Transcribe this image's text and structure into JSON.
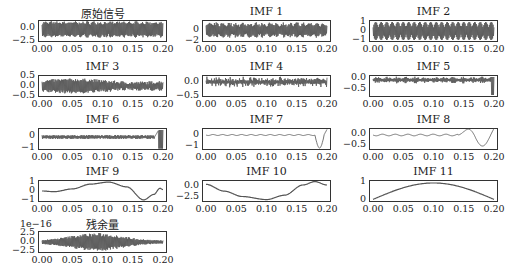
{
  "chart_data": [
    {
      "type": "line",
      "title": "原始信号",
      "xlabel": "",
      "ylabel": "",
      "x_ticks": [
        "0.00",
        "0.05",
        "0.10",
        "0.15",
        "0.20"
      ],
      "y_ticks": [
        "0.0",
        "−2.5"
      ],
      "xlim": [
        0,
        0.2
      ],
      "ylim": [
        -3,
        2.5
      ],
      "signal": "dense oscillation, amplitude ~±2.5, amplitude-modulated"
    },
    {
      "type": "line",
      "title": "IMF 1",
      "x_ticks": [
        "0.00",
        "0.05",
        "0.10",
        "0.15",
        "0.20"
      ],
      "y_ticks": [
        "0",
        "−2"
      ],
      "xlim": [
        0,
        0.2
      ],
      "ylim": [
        -2.2,
        1.8
      ],
      "signal": "dense high-frequency oscillation, amplitude ~±1.8"
    },
    {
      "type": "line",
      "title": "IMF 2",
      "x_ticks": [
        "0.00",
        "0.05",
        "0.10",
        "0.15",
        "0.20"
      ],
      "y_ticks": [
        "1",
        "0",
        "−1"
      ],
      "xlim": [
        0,
        0.2
      ],
      "ylim": [
        -1.3,
        1.3
      ],
      "signal": "dense oscillation, amplitude ~±1.2, beating envelope"
    },
    {
      "type": "line",
      "title": "IMF 3",
      "x_ticks": [
        "0.00",
        "0.05",
        "0.10",
        "0.15",
        "0.20"
      ],
      "y_ticks": [
        "0.5",
        "0.0",
        "−0.5"
      ],
      "xlim": [
        0,
        0.2
      ],
      "ylim": [
        -0.55,
        0.55
      ],
      "signal": "noisy oscillation, amplitude ~±0.4"
    },
    {
      "type": "line",
      "title": "IMF 4",
      "x_ticks": [
        "0.00",
        "0.05",
        "0.10",
        "0.15",
        "0.20"
      ],
      "y_ticks": [
        "0.0",
        "−0.5"
      ],
      "xlim": [
        0,
        0.2
      ],
      "ylim": [
        -0.6,
        0.35
      ],
      "signal": "bursty oscillation, amplitude ~±0.2"
    },
    {
      "type": "line",
      "title": "IMF 5",
      "x_ticks": [
        "0.00",
        "0.05",
        "0.10",
        "0.15",
        "0.20"
      ],
      "y_ticks": [
        "0.0",
        "−0.5"
      ],
      "xlim": [
        0,
        0.2
      ],
      "ylim": [
        -0.8,
        0.2
      ],
      "signal": "small oscillation near 0, large spike down at ~0.195"
    },
    {
      "type": "line",
      "title": "IMF 6",
      "x_ticks": [
        "0.00",
        "0.05",
        "0.10",
        "0.15",
        "0.20"
      ],
      "y_ticks": [
        "0",
        "−1"
      ],
      "xlim": [
        0,
        0.2
      ],
      "ylim": [
        -1.2,
        0.6
      ],
      "signal": "near 0 with small ripples; spike at ~0.19-0.195 reaching ~0.5 and ~-1.1"
    },
    {
      "type": "line",
      "title": "IMF 7",
      "x_ticks": [
        "0.00",
        "0.05",
        "0.10",
        "0.15",
        "0.20"
      ],
      "y_ticks": [
        "0",
        "−1"
      ],
      "xlim": [
        0,
        0.2
      ],
      "ylim": [
        -1.7,
        0.6
      ],
      "signal": "flat near 0 until ~0.18, dip to ~-1.6 at ~0.19, rise to ~0.5 at ~0.197"
    },
    {
      "type": "line",
      "title": "IMF 8",
      "x_ticks": [
        "0.00",
        "0.05",
        "0.10",
        "0.15",
        "0.20"
      ],
      "y_ticks": [
        "0.0",
        "−0.5"
      ],
      "xlim": [
        0,
        0.2
      ],
      "ylim": [
        -0.75,
        0.3
      ],
      "signal": "small wiggles near 0, bump +0.25 at ~0.165, dip -0.7 at ~0.18, peak +0.2 at ~0.195"
    },
    {
      "type": "line",
      "title": "IMF 9",
      "x_ticks": [
        "0.00",
        "0.05",
        "0.10",
        "0.15",
        "0.20"
      ],
      "y_ticks": [
        "1",
        "0",
        "−1"
      ],
      "xlim": [
        0,
        0.2
      ],
      "ylim": [
        -1.4,
        1.4
      ],
      "x": [
        0,
        0.02,
        0.05,
        0.08,
        0.11,
        0.14,
        0.168,
        0.185,
        0.195,
        0.2
      ],
      "values": [
        0.0,
        -0.1,
        0.3,
        1.0,
        1.3,
        0.6,
        -1.3,
        -0.5,
        0.4,
        0.2
      ]
    },
    {
      "type": "line",
      "title": "IMF 10",
      "x_ticks": [
        "0.00",
        "0.05",
        "0.10",
        "0.15",
        "0.20"
      ],
      "y_ticks": [
        "0.0",
        "−2.5"
      ],
      "xlim": [
        0,
        0.2
      ],
      "ylim": [
        -4.5,
        1.2
      ],
      "x": [
        0,
        0.03,
        0.06,
        0.1,
        0.13,
        0.16,
        0.18,
        0.2
      ],
      "values": [
        0.2,
        -1.8,
        -3.4,
        -4.3,
        -3.0,
        0.0,
        1.0,
        0.0
      ]
    },
    {
      "type": "line",
      "title": "IMF 11",
      "x_ticks": [
        "0.00",
        "0.05",
        "0.10",
        "0.15",
        "0.20"
      ],
      "y_ticks": [
        "1",
        "0"
      ],
      "xlim": [
        0,
        0.2
      ],
      "ylim": [
        -0.1,
        1.5
      ],
      "x": [
        0,
        0.05,
        0.1,
        0.15,
        0.2
      ],
      "values": [
        0.0,
        1.05,
        1.4,
        1.05,
        0.0
      ]
    },
    {
      "type": "line",
      "title": "残余量",
      "offset_label": "1e−16",
      "x_ticks": [
        "0.00",
        "0.05",
        "0.10",
        "0.15",
        "0.20"
      ],
      "y_ticks": [
        "2.5",
        "0.0",
        "−2.5"
      ],
      "xlim": [
        0,
        0.2
      ],
      "ylim": [
        -3.5,
        3.5
      ],
      "signal": "dense oscillation, envelope grows to ~±3e-16 at 0.06-0.12, then decays"
    }
  ],
  "panels": [
    {
      "title": "原始信号",
      "yt": [
        "0.0",
        "−2.5"
      ],
      "offset": ""
    },
    {
      "title": "IMF 1",
      "yt": [
        "0",
        "−2"
      ],
      "offset": ""
    },
    {
      "title": "IMF 2",
      "yt": [
        "1",
        "0",
        "−1"
      ],
      "offset": ""
    },
    {
      "title": "IMF 3",
      "yt": [
        "0.5",
        "0.0",
        "−0.5"
      ],
      "offset": ""
    },
    {
      "title": "IMF 4",
      "yt": [
        "0.0",
        "−0.5"
      ],
      "offset": ""
    },
    {
      "title": "IMF 5",
      "yt": [
        "0.0",
        "−0.5"
      ],
      "offset": ""
    },
    {
      "title": "IMF 6",
      "yt": [
        "0",
        "−1"
      ],
      "offset": ""
    },
    {
      "title": "IMF 7",
      "yt": [
        "0",
        "−1"
      ],
      "offset": ""
    },
    {
      "title": "IMF 8",
      "yt": [
        "0.0",
        "−0.5"
      ],
      "offset": ""
    },
    {
      "title": "IMF 9",
      "yt": [
        "1",
        "0",
        "−1"
      ],
      "offset": ""
    },
    {
      "title": "IMF 10",
      "yt": [
        "0.0",
        "−2.5"
      ],
      "offset": ""
    },
    {
      "title": "IMF 11",
      "yt": [
        "1",
        "0"
      ],
      "offset": ""
    },
    {
      "title": "残余量",
      "yt": [
        "2.5",
        "0.0",
        "−2.5"
      ],
      "offset": "1e−16"
    }
  ],
  "x_ticks": [
    "0.00",
    "0.05",
    "0.10",
    "0.15",
    "0.20"
  ],
  "colors": {
    "line": "#555555",
    "axis": "#333333",
    "background": "#ffffff"
  }
}
